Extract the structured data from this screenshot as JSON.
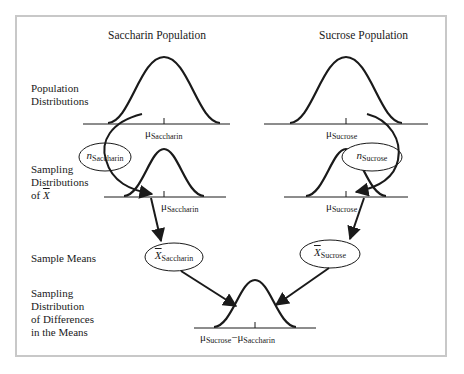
{
  "columns": {
    "left_title": "Saccharin Population",
    "right_title": "Sucrose Population"
  },
  "row_labels": {
    "population": [
      "Population",
      "Distributions"
    ],
    "sampling": [
      "Sampling",
      "Distributions",
      "of "
    ],
    "sampling_symbol": "X",
    "sample_means": "Sample Means",
    "difference": [
      "Sampling",
      "Distribution",
      "of Differences",
      "in the Means"
    ]
  },
  "symbols": {
    "mu": "μ",
    "n": "n",
    "xbar": "X",
    "minus": "−",
    "saccharin": "Saccharin",
    "sucrose": "Sucrose"
  },
  "nodes": {
    "n_saccharin": {
      "var": "n",
      "sub": "Saccharin"
    },
    "n_sucrose": {
      "var": "n",
      "sub": "Sucrose"
    },
    "xbar_saccharin": {
      "var": "X",
      "sub": "Saccharin"
    },
    "xbar_sucrose": {
      "var": "X",
      "sub": "Sucrose"
    }
  },
  "means": {
    "pop_saccharin": {
      "sym": "μ",
      "sub": "Saccharin"
    },
    "pop_sucrose": {
      "sym": "μ",
      "sub": "Sucrose"
    },
    "samp_saccharin": {
      "sym": "μ",
      "sub": "Saccharin"
    },
    "samp_sucrose": {
      "sym": "μ",
      "sub": "Sucrose"
    },
    "diff": {
      "sym1": "μ",
      "sub1": "Sucrose",
      "op": "−",
      "sym2": "μ",
      "sub2": "Saccharin"
    }
  },
  "colors": {
    "stroke": "#1a1a1a",
    "frame": "#c8c8c8",
    "background": "#ffffff"
  }
}
